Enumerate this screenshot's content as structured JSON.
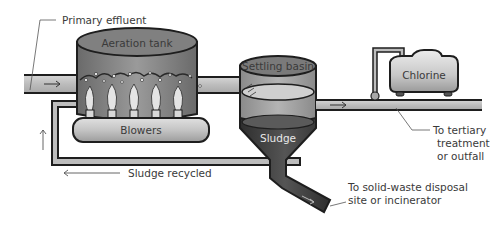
{
  "diagram": {
    "labels": {
      "primary_effluent": "Primary effluent",
      "aeration_tank": "Aeration tank",
      "blowers": "Blowers",
      "settling_basin": "Settling basin",
      "sludge": "Sludge",
      "chlorine": "Chlorine",
      "sludge_recycled": "Sludge recycled",
      "to_tertiary_line1": "To tertiary",
      "to_tertiary_line2": "treatment",
      "to_tertiary_line3": "or outfall",
      "to_solid_waste_line1": "To solid-waste disposal",
      "to_solid_waste_line2": "site or incinerator"
    },
    "colors": {
      "pipe_outline": "#1e1e1e",
      "pipe_fill": "#bdbdbd",
      "tank_dark": "#6e6e6e",
      "tank_mid": "#8a8a8a",
      "sludge_dark": "#3c3c3c",
      "blower_fill": "#c8c8c8",
      "label_text": "#3a3a3a"
    },
    "nodes": [
      {
        "id": "aeration_tank",
        "label": "Aeration tank"
      },
      {
        "id": "blowers",
        "label": "Blowers"
      },
      {
        "id": "settling_basin",
        "label": "Settling basin"
      },
      {
        "id": "sludge",
        "label": "Sludge"
      },
      {
        "id": "chlorine",
        "label": "Chlorine"
      }
    ],
    "edges": [
      {
        "from": "primary_effluent",
        "to": "aeration_tank"
      },
      {
        "from": "blowers",
        "to": "aeration_tank"
      },
      {
        "from": "aeration_tank",
        "to": "settling_basin"
      },
      {
        "from": "chlorine",
        "to": "effluent_pipe"
      },
      {
        "from": "settling_basin",
        "to": "tertiary_treatment_or_outfall"
      },
      {
        "from": "sludge",
        "to": "aeration_tank",
        "label": "Sludge recycled"
      },
      {
        "from": "sludge",
        "to": "solid_waste_disposal_or_incinerator"
      }
    ]
  }
}
